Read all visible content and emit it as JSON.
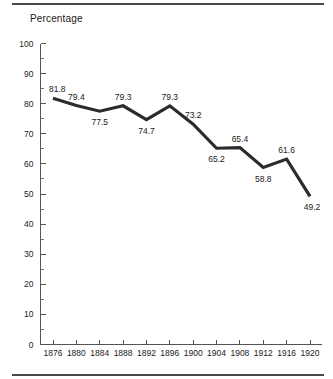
{
  "chart_data": {
    "type": "line",
    "title": "",
    "ylabel": "Percentage",
    "xlabel": "",
    "categories": [
      "1876",
      "1880",
      "1884",
      "1888",
      "1892",
      "1896",
      "1900",
      "1904",
      "1908",
      "1912",
      "1916",
      "1920"
    ],
    "values": [
      81.8,
      79.4,
      77.5,
      79.3,
      74.7,
      79.3,
      73.2,
      65.2,
      65.4,
      58.8,
      61.6,
      49.2
    ],
    "point_labels": [
      "81.8",
      "79.4",
      "77.5",
      "79.3",
      "74.7",
      "79.3",
      "73.2",
      "65.2",
      "65.4",
      "58.8",
      "61.6",
      "49.2"
    ],
    "label_positions": [
      "above",
      "above",
      "below",
      "above",
      "below",
      "above",
      "above",
      "below",
      "above",
      "below",
      "above",
      "below"
    ],
    "ylim": [
      0,
      100
    ],
    "y_ticks": [
      0,
      10,
      20,
      30,
      40,
      50,
      60,
      70,
      80,
      90,
      100
    ],
    "y_tick_labels": [
      "0",
      "10",
      "20",
      "30",
      "40",
      "50",
      "60",
      "70",
      "80",
      "90",
      "100"
    ],
    "y_minor_ticks": [
      5,
      15,
      25,
      35,
      45,
      55,
      65,
      75,
      85,
      95
    ],
    "grid": false,
    "legend": "none",
    "series_color": "#2b2b2b",
    "axis_color": "#555555",
    "background": "#ffffff"
  },
  "figure": {
    "top_rule": "horizontal-rule",
    "bottom_rule": "horizontal-rule"
  }
}
